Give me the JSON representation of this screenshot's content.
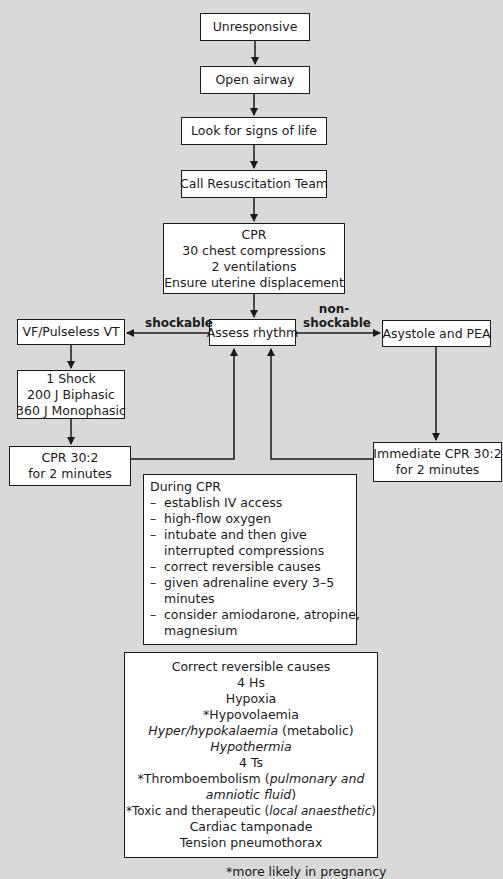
{
  "flowchart": {
    "nodes": {
      "unresponsive": "Unresponsive",
      "open_airway": "Open airway",
      "look_signs": "Look for signs of life",
      "call_team": "Call Resuscitation Team",
      "cpr": [
        "CPR",
        "30 chest compressions",
        "2 ventilations",
        "Ensure uterine displacement"
      ],
      "assess_rhythm": "Assess rhythm",
      "vf_vt": "VF/Pulseless VT",
      "asystole_pea": "Asystole and PEA",
      "shock": [
        "1 Shock",
        "200 J Biphasic",
        "360 J Monophasic"
      ],
      "cpr_left": [
        "CPR 30:2",
        "for 2 minutes"
      ],
      "cpr_right": [
        "Immediate CPR 30:2",
        "for 2 minutes"
      ]
    },
    "edge_labels": {
      "shockable": "shockable",
      "non_shockable_1": "non-",
      "non_shockable_2": "shockable"
    },
    "during_cpr": {
      "title": "During CPR",
      "dash": "–",
      "items": [
        [
          "establish IV access"
        ],
        [
          "high-flow oxygen"
        ],
        [
          "intubate and then give",
          "interrupted compressions"
        ],
        [
          "correct reversible causes"
        ],
        [
          "given adrenaline every 3–5",
          "minutes"
        ],
        [
          "consider amiodarone, atropine,",
          "magnesium"
        ]
      ]
    },
    "reversible_causes": {
      "title": "Correct reversible causes",
      "hs_heading": "4 Hs",
      "hypoxia": "Hypoxia",
      "hypovolaemia": "*Hypovolaemia",
      "hyperkal_italic": "Hyper/hypokalaemia",
      "hyperkal_rest": " (metabolic)",
      "hypothermia": "Hypothermia",
      "ts_heading": "4 Ts",
      "thrombo_pre": "*Thromboembolism (",
      "thrombo_italic_1": "pulmonary and",
      "thrombo_italic_2": "amniotic fluid",
      "thrombo_post": ")",
      "toxic_pre": "*Toxic and therapeutic (",
      "toxic_italic": "local anaesthetic",
      "toxic_post": ")",
      "tamponade": "Cardiac tamponade",
      "pneumothorax": "Tension pneumothorax"
    },
    "footnote": "*more likely in pregnancy"
  }
}
